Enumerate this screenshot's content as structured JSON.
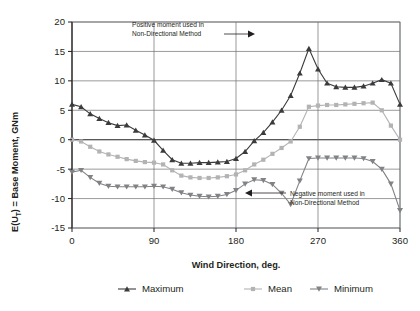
{
  "chart_data": {
    "type": "line",
    "title": "",
    "xlabel": "Wind Direction, deg.",
    "ylabel": "E(U_T) = Base Moment, GNm",
    "ylabel_rich": {
      "prefix": "E(U",
      "subscript": "T",
      "suffix": ") = Base Moment, GNm"
    },
    "xlim": [
      0,
      360
    ],
    "ylim": [
      -15,
      20
    ],
    "xticks": [
      0,
      90,
      180,
      270,
      360
    ],
    "yticks": [
      -15,
      -10,
      -5,
      0,
      5,
      10,
      15,
      20
    ],
    "xticklabels": [
      "0",
      "90",
      "180",
      "270",
      "360"
    ],
    "yticklabels": [
      "-15",
      "-10",
      "-5",
      "0",
      "5",
      "10",
      "15",
      "20"
    ],
    "grid": "horizontal-and-vertical",
    "legend_position": "below",
    "x": [
      0,
      10,
      20,
      30,
      40,
      50,
      60,
      70,
      80,
      90,
      100,
      110,
      120,
      130,
      140,
      150,
      160,
      170,
      180,
      190,
      200,
      210,
      220,
      230,
      240,
      250,
      260,
      270,
      280,
      290,
      300,
      310,
      320,
      330,
      340,
      350,
      360
    ],
    "series": [
      {
        "name": "Maximum",
        "color": "#3b3b3d",
        "marker": "triangle-up",
        "values": [
          6.0,
          5.6,
          4.4,
          3.6,
          2.9,
          2.4,
          2.5,
          1.6,
          0.8,
          -0.1,
          -1.8,
          -3.4,
          -4.0,
          -4.0,
          -3.9,
          -3.9,
          -3.8,
          -3.7,
          -3.2,
          -2.0,
          -0.2,
          1.2,
          3.0,
          5.0,
          7.5,
          11.3,
          15.5,
          12.0,
          9.6,
          9.0,
          8.9,
          8.9,
          9.1,
          9.6,
          10.2,
          9.6,
          6.0
        ]
      },
      {
        "name": "Mean",
        "color": "#b3b3b5",
        "marker": "square",
        "values": [
          0.0,
          -0.3,
          -1.2,
          -2.0,
          -2.5,
          -2.9,
          -3.3,
          -3.6,
          -3.8,
          -3.9,
          -4.2,
          -5.2,
          -6.1,
          -6.4,
          -6.5,
          -6.5,
          -6.4,
          -6.2,
          -5.9,
          -5.2,
          -4.2,
          -3.4,
          -2.4,
          -1.4,
          -0.3,
          2.2,
          5.6,
          5.8,
          5.9,
          5.9,
          6.0,
          6.1,
          6.2,
          6.3,
          5.0,
          2.4,
          0.0
        ]
      },
      {
        "name": "Minimum",
        "color": "#808285",
        "marker": "triangle-down",
        "values": [
          -5.5,
          -5.2,
          -6.4,
          -7.4,
          -7.9,
          -8.0,
          -8.0,
          -8.0,
          -8.0,
          -7.9,
          -8.0,
          -8.4,
          -9.0,
          -9.4,
          -9.6,
          -9.7,
          -9.6,
          -9.3,
          -8.6,
          -7.5,
          -6.8,
          -6.9,
          -7.6,
          -9.1,
          -11.0,
          -7.0,
          -3.2,
          -3.1,
          -3.1,
          -3.1,
          -3.1,
          -3.1,
          -3.2,
          -3.7,
          -5.0,
          -7.5,
          -12.0
        ]
      }
    ],
    "annotations": [
      {
        "id": "positive-moment",
        "lines": [
          "Positive moment used in",
          "Non-Directional Method"
        ],
        "points_to": {
          "x": 260,
          "y": 15.5
        }
      },
      {
        "id": "negative-moment",
        "lines": [
          "Negative moment used in",
          "Non-Directional Method"
        ],
        "points_to": {
          "x": 240,
          "y": -11.0
        }
      }
    ]
  },
  "legend": {
    "items": [
      {
        "label": "Maximum"
      },
      {
        "label": "Mean"
      },
      {
        "label": "Minimum"
      }
    ]
  }
}
